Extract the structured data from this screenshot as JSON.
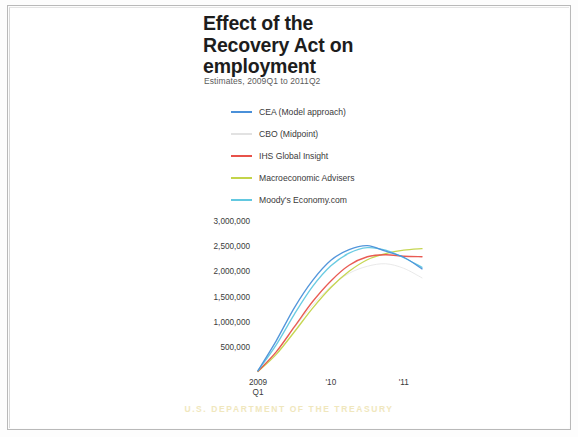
{
  "slide": {
    "title_line1": "Effect of the",
    "title_line2": "Recovery Act on",
    "title_line3": "employment",
    "subtitle": "Estimates, 2009Q1 to 2011Q2",
    "footer": "U.S. DEPARTMENT OF THE TREASURY"
  },
  "colors": {
    "cea": "#4a90d9",
    "cbo": "#e2e2e2",
    "ihs": "#e8524a",
    "macro": "#c3d44a",
    "moodys": "#62c8e0",
    "text": "#3a3a3a",
    "title": "#1d1d1d",
    "watermark": "#efe6b8"
  },
  "chart_data": {
    "type": "line",
    "title": "Effect of the Recovery Act on employment",
    "subtitle": "Estimates, 2009Q1 to 2011Q2",
    "xlabel": "",
    "ylabel": "",
    "grid": false,
    "legend_position": "above-left",
    "ylim": [
      0,
      3000000
    ],
    "yticks": [
      "3,000,000",
      "2,500,000",
      "2,000,000",
      "1,500,000",
      "1,000,000",
      "500,000"
    ],
    "ytick_values": [
      3000000,
      2500000,
      2000000,
      1500000,
      1000000,
      500000
    ],
    "x": [
      "2009Q1",
      "2009Q2",
      "2009Q3",
      "2009Q4",
      "2010Q1",
      "2010Q2",
      "2010Q3",
      "2010Q4",
      "2011Q1",
      "2011Q2"
    ],
    "xticks": [
      {
        "label_line1": "2009",
        "label_line2": "Q1",
        "index": 0
      },
      {
        "label_line1": "'10",
        "label_line2": "",
        "index": 4
      },
      {
        "label_line1": "'11",
        "label_line2": "",
        "index": 8
      }
    ],
    "series": [
      {
        "name": "CEA (Model approach)",
        "color": "#4a90d9",
        "values": [
          30000,
          620000,
          1280000,
          1820000,
          2220000,
          2430000,
          2510000,
          2400000,
          2280000,
          2050000
        ]
      },
      {
        "name": "CBO (Midpoint)",
        "color": "#e2e2e2",
        "values": [
          20000,
          400000,
          880000,
          1330000,
          1700000,
          1960000,
          2100000,
          2150000,
          2060000,
          1870000
        ]
      },
      {
        "name": "IHS Global Insight",
        "color": "#e8524a",
        "values": [
          15000,
          400000,
          900000,
          1400000,
          1810000,
          2120000,
          2290000,
          2330000,
          2300000,
          2290000
        ]
      },
      {
        "name": "Macroeconomic Advisers",
        "color": "#c3d44a",
        "values": [
          10000,
          350000,
          800000,
          1270000,
          1680000,
          2000000,
          2230000,
          2350000,
          2420000,
          2450000
        ]
      },
      {
        "name": "Moody's Economy.com",
        "color": "#62c8e0",
        "values": [
          25000,
          540000,
          1150000,
          1700000,
          2110000,
          2360000,
          2470000,
          2420000,
          2270000,
          2080000
        ]
      }
    ]
  },
  "legend": {
    "items": [
      {
        "label": "CEA (Model approach)",
        "color": "#4a90d9"
      },
      {
        "label": "CBO (Midpoint)",
        "color": "#e2e2e2"
      },
      {
        "label": "IHS Global Insight",
        "color": "#e8524a"
      },
      {
        "label": "Macroeconomic Advisers",
        "color": "#c3d44a"
      },
      {
        "label": "Moody's Economy.com",
        "color": "#62c8e0"
      }
    ]
  }
}
